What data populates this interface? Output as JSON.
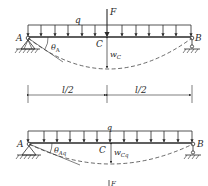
{
  "diagram": {
    "top_beam": {
      "labels": {
        "left_support": "A",
        "right_support": "B",
        "midpoint": "C",
        "distributed_load": "q",
        "point_force": "F",
        "rotation": "θ",
        "rotation_sub": "A",
        "deflection": "w",
        "deflection_sub": "C"
      }
    },
    "dimension": {
      "left_span": "l/2",
      "right_span": "l/2"
    },
    "bottom_beam": {
      "labels": {
        "left_support": "A",
        "right_support": "B",
        "midpoint": "C",
        "distributed_load": "q",
        "rotation": "θ",
        "rotation_sub": "Aq",
        "deflection": "w",
        "deflection_sub": "Cq"
      }
    },
    "partial_next": {
      "label": "F"
    },
    "colors": {
      "line": "#2a2a2a",
      "background": "#ffffff"
    }
  }
}
